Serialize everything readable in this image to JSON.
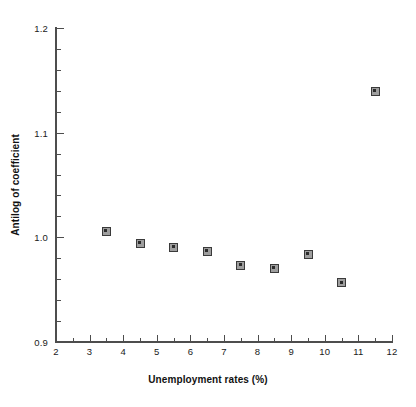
{
  "chart_data": {
    "type": "scatter",
    "title": "",
    "xlabel": "Unemployment rates (%)",
    "ylabel": "Antilog of coefficient",
    "xlim": [
      2,
      12
    ],
    "ylim": [
      0.9,
      1.2
    ],
    "grid": false,
    "legend": null,
    "x_major_ticks": [
      "2",
      "3",
      "4",
      "5",
      "6",
      "7",
      "8",
      "9",
      "10",
      "11",
      "12"
    ],
    "x_major_values": [
      2,
      3,
      4,
      5,
      6,
      7,
      8,
      9,
      10,
      11,
      12
    ],
    "x_minor_values": [
      2.5,
      3.5,
      4.5,
      5.5,
      6.5,
      7.5,
      8.5,
      9.5,
      10.5,
      11.5
    ],
    "y_major_ticks": [
      "0.9",
      "1.0",
      "1.1",
      "1.2"
    ],
    "y_major_values": [
      0.9,
      1.0,
      1.1,
      1.2
    ],
    "y_minor_values": [
      0.92,
      0.94,
      0.96,
      0.98,
      1.02,
      1.04,
      1.06,
      1.08,
      1.12,
      1.14,
      1.16,
      1.18
    ],
    "marker_style": "open-square",
    "marker_color": "#3a3a3a",
    "points": [
      {
        "x": 3.5,
        "y": 1.006
      },
      {
        "x": 4.5,
        "y": 0.9945
      },
      {
        "x": 5.5,
        "y": 0.9905
      },
      {
        "x": 6.5,
        "y": 0.9865
      },
      {
        "x": 7.5,
        "y": 0.9735
      },
      {
        "x": 8.5,
        "y": 0.9705
      },
      {
        "x": 9.5,
        "y": 0.984
      },
      {
        "x": 10.5,
        "y": 0.9565
      },
      {
        "x": 11.5,
        "y": 1.1395
      }
    ]
  }
}
